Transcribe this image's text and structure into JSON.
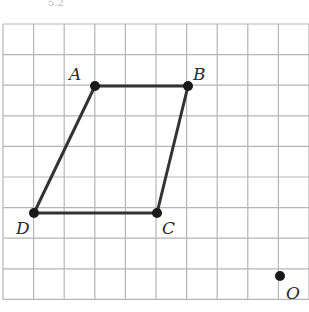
{
  "caption": "5.2",
  "grid": {
    "x0": 3,
    "y0": 24,
    "cell": 30.6,
    "cols": 10,
    "rows": 9,
    "line_color": "#b5b5b5"
  },
  "figure": {
    "shape": "parallelogram",
    "stroke_color": "#333333",
    "points": [
      {
        "name": "A",
        "x": 95,
        "y": 86,
        "lx": 69,
        "ly": 80
      },
      {
        "name": "B",
        "x": 188,
        "y": 86,
        "lx": 193,
        "ly": 80
      },
      {
        "name": "C",
        "x": 157,
        "y": 213,
        "lx": 162,
        "ly": 234
      },
      {
        "name": "D",
        "x": 34,
        "y": 213,
        "lx": 16,
        "ly": 234
      }
    ],
    "center": {
      "name": "O",
      "x": 280,
      "y": 276,
      "lx": 286,
      "ly": 299
    }
  }
}
